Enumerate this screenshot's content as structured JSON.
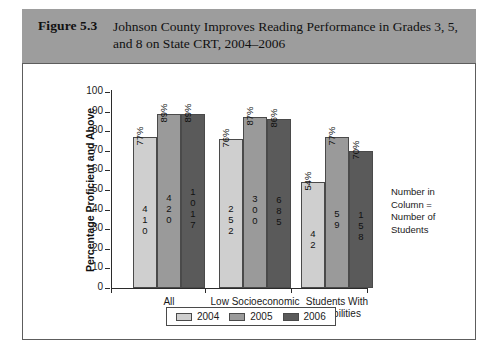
{
  "figure": {
    "number_label": "Figure 5.3",
    "title": "Johnson County Improves Reading Performance in Grades 3, 5, and 8 on State CRT, 2004–2006"
  },
  "note": {
    "line1": "Number in",
    "line2": "Column =",
    "line3": "Number of",
    "line4": "Students"
  },
  "colors": {
    "header_band": "#9d9d9d",
    "series_2004": "#cfcfcf",
    "series_2005": "#9a9a9a",
    "series_2006": "#5a5a5a",
    "axis": "#2b2b2b",
    "panel_border": "#5d5d5d"
  },
  "chart_data": {
    "type": "bar",
    "title": "Johnson County Improves Reading Performance in Grades 3, 5, and 8 on State CRT, 2004–2006",
    "xlabel": "",
    "ylabel": "Percentage Proficient and Above",
    "ylim": [
      0,
      100
    ],
    "ytick_labels": [
      "100",
      "90",
      "80",
      "70",
      "60",
      "50",
      "40",
      "30",
      "20",
      "10",
      "0"
    ],
    "ytick_values": [
      100,
      90,
      80,
      70,
      60,
      50,
      40,
      30,
      20,
      10,
      0
    ],
    "grid": false,
    "legend_position": "bottom",
    "categories": [
      "All",
      "Low Socioeconomic Status",
      "Students With Disabilities"
    ],
    "category_lines": [
      [
        "All"
      ],
      [
        "Low Socioeconomic",
        "Status"
      ],
      [
        "Students With",
        "Disabilities"
      ]
    ],
    "series": [
      {
        "name": "2004",
        "color": "#cfcfcf",
        "values": [
          77,
          76,
          54
        ],
        "value_labels": [
          "77%",
          "76%",
          "54%"
        ],
        "counts": [
          410,
          252,
          42
        ],
        "count_digits": [
          [
            "4",
            "1",
            "0"
          ],
          [
            "2",
            "5",
            "2"
          ],
          [
            "4",
            "2"
          ]
        ]
      },
      {
        "name": "2005",
        "color": "#9a9a9a",
        "values": [
          89,
          87,
          77
        ],
        "value_labels": [
          "89%",
          "87%",
          "77%"
        ],
        "counts": [
          420,
          300,
          59
        ],
        "count_digits": [
          [
            "4",
            "2",
            "0"
          ],
          [
            "3",
            "0",
            "0"
          ],
          [
            "5",
            "9"
          ]
        ]
      },
      {
        "name": "2006",
        "color": "#5a5a5a",
        "values": [
          89,
          86,
          70
        ],
        "value_labels": [
          "89%",
          "86%",
          "70%"
        ],
        "counts": [
          1017,
          685,
          158
        ],
        "count_digits": [
          [
            "1",
            "0",
            "1",
            "7"
          ],
          [
            "6",
            "8",
            "5"
          ],
          [
            "1",
            "5",
            "8"
          ]
        ]
      }
    ],
    "annotation": "Number in Column = Number of Students"
  }
}
